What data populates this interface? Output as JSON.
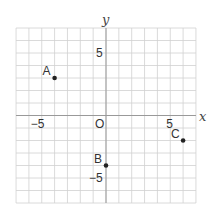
{
  "chart_data": {
    "type": "scatter",
    "title": "",
    "xlabel": "x",
    "ylabel": "y",
    "xlim": [
      -7,
      7
    ],
    "ylim": [
      -7,
      7
    ],
    "grid": true,
    "origin_label": "O",
    "x_tick_labels": [
      {
        "value": -5,
        "label": "−5"
      },
      {
        "value": 5,
        "label": "5"
      }
    ],
    "y_tick_labels": [
      {
        "value": 5,
        "label": "5"
      },
      {
        "value": -5,
        "label": "−5"
      }
    ],
    "points": [
      {
        "name": "A",
        "x": -4,
        "y": 3
      },
      {
        "name": "B",
        "x": 0,
        "y": -4
      },
      {
        "name": "C",
        "x": 6,
        "y": -2
      }
    ]
  },
  "colors": {
    "grid": "#d0d0d0",
    "axis": "#999999",
    "point": "#222222"
  }
}
